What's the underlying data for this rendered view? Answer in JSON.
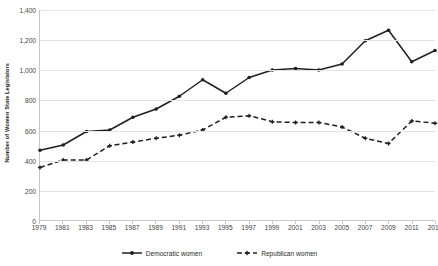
{
  "chart_data": {
    "type": "line",
    "title": "",
    "subtitle": "",
    "xlabel": "",
    "ylabel": "Number of Women State Legislators",
    "grid": true,
    "legend_position": "bottom",
    "xlim": [
      1979,
      2013
    ],
    "ylim": [
      0,
      1400
    ],
    "y_ticks": [
      0,
      200,
      400,
      600,
      800,
      1000,
      1200,
      1400
    ],
    "y_tick_labels": [
      "0",
      "200",
      "400",
      "600",
      "800",
      "1,000",
      "1,200",
      "1,400"
    ],
    "categories": [
      1979,
      1981,
      1983,
      1985,
      1987,
      1989,
      1991,
      1993,
      1995,
      1997,
      1999,
      2001,
      2003,
      2005,
      2007,
      2009,
      2011,
      2013
    ],
    "x_tick_labels": [
      "1979",
      "1981",
      "1983",
      "1985",
      "1987",
      "1989",
      "1991",
      "1993",
      "1995",
      "1997",
      "1999",
      "2001",
      "2003",
      "2005",
      "2007",
      "2009",
      "2011",
      "2013"
    ],
    "series": [
      {
        "name": "Democratic women",
        "style": "solid",
        "color": "#1f1f1f",
        "marker": "diamond",
        "values": [
          465,
          500,
          590,
          600,
          685,
          740,
          825,
          935,
          845,
          950,
          1000,
          1010,
          1000,
          1040,
          1195,
          1265,
          1055,
          1130
        ]
      },
      {
        "name": "Republican women",
        "style": "dashed",
        "color": "#1f1f1f",
        "marker": "plus",
        "values": [
          350,
          400,
          400,
          495,
          520,
          545,
          565,
          600,
          685,
          695,
          655,
          650,
          650,
          620,
          545,
          510,
          660,
          645
        ]
      }
    ]
  },
  "legend": {
    "entries": [
      {
        "label": "Democratic women",
        "icon": "solid-line-with-marker-icon"
      },
      {
        "label": "Republican women",
        "icon": "dashed-line-with-marker-icon"
      }
    ]
  }
}
